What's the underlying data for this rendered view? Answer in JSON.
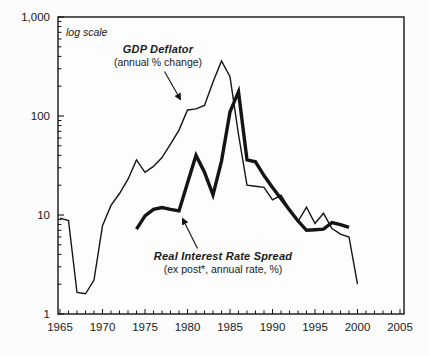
{
  "figure": {
    "scale_note": "log scale",
    "y_axis": {
      "ticks": [
        {
          "value": 1000,
          "label": "1,000"
        },
        {
          "value": 100,
          "label": "100"
        },
        {
          "value": 10,
          "label": "10"
        },
        {
          "value": 1,
          "label": "1"
        }
      ]
    },
    "x_axis": {
      "labeled_years": [
        1965,
        1970,
        1975,
        1980,
        1985,
        1990,
        1995,
        2000,
        2005
      ],
      "minor_tick_every_years": 1
    }
  },
  "colors": {
    "line": "#141414",
    "text": "#1a1a1a",
    "background": "#fcfcfc"
  },
  "chart_data": {
    "type": "line",
    "title": "",
    "xlabel": "",
    "ylabel": "",
    "y_scale": "log",
    "ylim": [
      1,
      1000
    ],
    "xlim": [
      1965,
      2005
    ],
    "grid": false,
    "legend_position": "inline-annotations",
    "series": [
      {
        "name": "GDP Deflator",
        "label_line1": "GDP Deflator",
        "label_line2": "(annual % change)",
        "line_weight": "thin",
        "years": [
          1965,
          1966,
          1967,
          1968,
          1969,
          1970,
          1971,
          1972,
          1973,
          1974,
          1975,
          1976,
          1977,
          1978,
          1979,
          1980,
          1981,
          1982,
          1983,
          1984,
          1985,
          1986,
          1987,
          1988,
          1989,
          1990,
          1991,
          1992,
          1993,
          1994,
          1995,
          1996,
          1997,
          1998,
          1999,
          2000
        ],
        "values": [
          9.3,
          8.8,
          1.65,
          1.6,
          2.2,
          7.8,
          12.5,
          16.5,
          23,
          36,
          27,
          31,
          38,
          52,
          72,
          115,
          118,
          128,
          220,
          360,
          250,
          65,
          20,
          19.5,
          19,
          14.2,
          15.8,
          11.5,
          8.6,
          12,
          8.2,
          10.4,
          7.3,
          6.4,
          6.0,
          2.0
        ]
      },
      {
        "name": "Real Interest Rate Spread",
        "label_line1": "Real Interest Rate Spread",
        "label_line2": "(ex post*, annual rate, %)",
        "line_weight": "thick",
        "years": [
          1974,
          1975,
          1976,
          1977,
          1978,
          1979,
          1980,
          1981,
          1982,
          1983,
          1984,
          1985,
          1986,
          1987,
          1988,
          1989,
          1990,
          1991,
          1992,
          1993,
          1994,
          1995,
          1996,
          1997,
          1998,
          1999
        ],
        "values": [
          7.2,
          9.8,
          11.4,
          11.9,
          11.4,
          11.0,
          21,
          40,
          27,
          16,
          35,
          110,
          176,
          36,
          34.5,
          25,
          19,
          14.6,
          11.2,
          8.7,
          7.0,
          7.1,
          7.2,
          8.4,
          8.0,
          7.5
        ]
      }
    ]
  }
}
